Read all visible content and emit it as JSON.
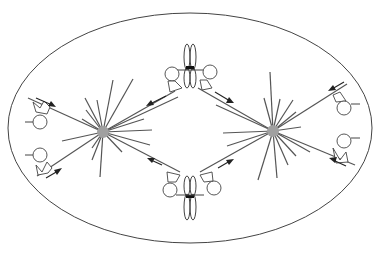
{
  "diagram": {
    "title": "",
    "colors": {
      "background": "#ffffff",
      "line": "#444444",
      "pole": "#a0a0a0",
      "arrow": "#222222"
    },
    "cell": {
      "cx": 190,
      "cy": 128,
      "rx": 182,
      "ry": 115
    },
    "poles": [
      {
        "id": "left-pole",
        "cx": 103,
        "cy": 132,
        "r": 6
      },
      {
        "id": "right-pole",
        "cx": 273,
        "cy": 131,
        "r": 6
      }
    ],
    "chromosomes": [
      {
        "id": "top-chromosome",
        "cx": 190,
        "cy": 67
      },
      {
        "id": "bottom-chromosome",
        "cx": 190,
        "cy": 196
      }
    ],
    "motor_groups": [
      {
        "id": "cortex-left-top"
      },
      {
        "id": "cortex-left-bottom"
      },
      {
        "id": "cortex-right-top"
      },
      {
        "id": "cortex-right-bottom"
      },
      {
        "id": "kinetochore-top-left"
      },
      {
        "id": "kinetochore-top-right"
      },
      {
        "id": "kinetochore-bottom-left"
      },
      {
        "id": "kinetochore-bottom-right"
      }
    ],
    "arrows_count": 8,
    "labels": []
  }
}
